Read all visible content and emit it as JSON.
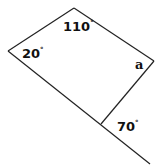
{
  "diagram": {
    "type": "quadrilateral-angle-problem",
    "stroke_color": "#222222",
    "background": "#ffffff",
    "vertices": {
      "top": [
        74,
        8
      ],
      "left": [
        8,
        51
      ],
      "right": [
        154,
        61
      ],
      "bottom": [
        101,
        124
      ]
    },
    "extension_line_end": [
      150,
      164
    ],
    "angles": [
      {
        "id": "top",
        "value": "110",
        "degree": "°"
      },
      {
        "id": "left",
        "value": "20",
        "degree": "°"
      },
      {
        "id": "right",
        "value": "a",
        "degree": ""
      },
      {
        "id": "exterior-bottom",
        "value": "70",
        "degree": "°"
      }
    ]
  }
}
